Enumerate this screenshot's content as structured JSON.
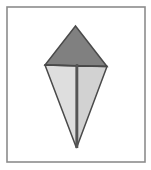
{
  "figure": {
    "canvas": {
      "width": 151,
      "height": 170,
      "background": "#ffffff"
    },
    "frame": {
      "label": "figure-frame",
      "x": 7,
      "y": 7,
      "width": 138,
      "height": 155,
      "stroke": "#8c8c8c",
      "stroke_width": 1.6,
      "fill": "#ffffff"
    },
    "shape": {
      "name": "kite",
      "vertices": {
        "top": {
          "x": 75.5,
          "y": 26
        },
        "left": {
          "x": 45,
          "y": 65
        },
        "right": {
          "x": 107,
          "y": 66.5
        },
        "bottom": {
          "x": 76.5,
          "y": 148
        }
      },
      "outline_stroke": "#4a4a4a",
      "outline_width": 1.5,
      "faces": [
        {
          "name": "upper-triangle",
          "points": "75.5,26 45,65 107,66.5",
          "fill": "#808080",
          "stroke": "#4a4a4a",
          "stroke_width": 1.5
        },
        {
          "name": "lower-left-triangle",
          "points": "45,65 76.5,66 76.5,148",
          "fill": "#dedede",
          "stroke": "#4a4a4a",
          "stroke_width": 1.5
        },
        {
          "name": "lower-right-triangle",
          "points": "76.5,66 107,66.5 76.5,148",
          "fill": "#d2d2d2",
          "stroke": "#4a4a4a",
          "stroke_width": 1.5
        }
      ],
      "spine": {
        "name": "vertical-spine",
        "x1": 77,
        "y1": 64,
        "x2": 77,
        "y2": 148,
        "stroke": "#555555",
        "stroke_width": 2.6
      },
      "fold_line": {
        "name": "horizontal-fold",
        "x1": 45,
        "y1": 65,
        "x2": 107,
        "y2": 66.5,
        "stroke": "#4a4a4a",
        "stroke_width": 1.5
      }
    },
    "colors": {
      "frame_stroke": "#8c8c8c",
      "outline": "#4a4a4a",
      "upper_fill": "#808080",
      "lower_left_fill": "#dedede",
      "lower_right_fill": "#d2d2d2",
      "spine": "#555555",
      "background": "#ffffff"
    }
  }
}
